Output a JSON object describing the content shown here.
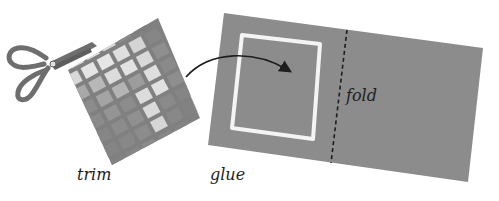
{
  "illustration": {
    "steps": [
      {
        "id": "trim",
        "label": "trim"
      },
      {
        "id": "glue",
        "label": "glue"
      },
      {
        "id": "fold",
        "label": "fold"
      }
    ],
    "colors": {
      "paper_dark": "#7a7a7a",
      "paper_mid": "#9a9a9a",
      "paper_light": "#d4d4d4",
      "paper_lightest": "#e6e6e6",
      "card": "#8c8c8c",
      "glue_outline": "#f4f4f4",
      "scissors": "#6e6e6e",
      "ink": "#1e1e1e"
    }
  }
}
